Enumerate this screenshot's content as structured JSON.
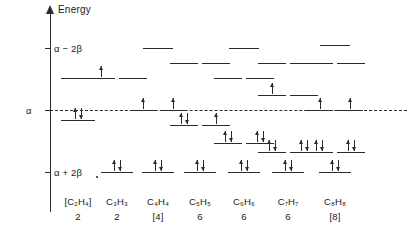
{
  "chart_data": {
    "type": "energy-level-diagram",
    "title": "",
    "ylabel": "Energy",
    "axis": {
      "ticks": [
        {
          "label": "α − 2β",
          "y": 48
        },
        {
          "label": "α",
          "y": 110
        },
        {
          "label": "α + 2β",
          "y": 172
        }
      ],
      "reference_line": "α",
      "grid": false
    },
    "columns": [
      {
        "formula": "[C₂H₄]",
        "electron_count": "2",
        "x": 78,
        "levels": [
          {
            "y": 78,
            "width": 34,
            "offset": 0,
            "electrons": ""
          },
          {
            "y": 120,
            "width": 34,
            "offset": 0,
            "electrons": "updown"
          }
        ]
      },
      {
        "formula": "C₃H₃",
        "electron_count": "2",
        "x": 117,
        "levels": [
          {
            "y": 78,
            "width": 28,
            "offset": -16,
            "electrons": "up"
          },
          {
            "y": 78,
            "width": 28,
            "offset": 16,
            "electrons": ""
          },
          {
            "y": 172,
            "width": 32,
            "offset": 0,
            "electrons": "updown"
          }
        ]
      },
      {
        "formula": "C₄H₄",
        "electron_count": "[4]",
        "x": 158,
        "levels": [
          {
            "y": 48,
            "width": 30,
            "offset": 0,
            "electrons": ""
          },
          {
            "y": 110,
            "width": 26,
            "offset": -15,
            "electrons": "up"
          },
          {
            "y": 110,
            "width": 26,
            "offset": 15,
            "electrons": "up"
          },
          {
            "y": 172,
            "width": 32,
            "offset": 0,
            "electrons": "updown"
          }
        ]
      },
      {
        "formula": "C₅H₅",
        "electron_count": "6",
        "x": 200,
        "levels": [
          {
            "y": 63,
            "width": 28,
            "offset": -16,
            "electrons": ""
          },
          {
            "y": 63,
            "width": 28,
            "offset": 16,
            "electrons": ""
          },
          {
            "y": 125,
            "width": 28,
            "offset": -16,
            "electrons": "updown"
          },
          {
            "y": 125,
            "width": 28,
            "offset": 16,
            "electrons": "up"
          },
          {
            "y": 172,
            "width": 32,
            "offset": 0,
            "electrons": "updown"
          }
        ]
      },
      {
        "formula": "C₆H₆",
        "electron_count": "6",
        "x": 244,
        "levels": [
          {
            "y": 48,
            "width": 30,
            "offset": 0,
            "electrons": ""
          },
          {
            "y": 78,
            "width": 28,
            "offset": -16,
            "electrons": ""
          },
          {
            "y": 78,
            "width": 28,
            "offset": 16,
            "electrons": ""
          },
          {
            "y": 143,
            "width": 28,
            "offset": -16,
            "electrons": "updown"
          },
          {
            "y": 143,
            "width": 28,
            "offset": 16,
            "electrons": "updown"
          },
          {
            "y": 172,
            "width": 32,
            "offset": 0,
            "electrons": "updown"
          }
        ]
      },
      {
        "formula": "C₇H₇",
        "electron_count": "6",
        "x": 288,
        "levels": [
          {
            "y": 63,
            "width": 28,
            "offset": -16,
            "electrons": ""
          },
          {
            "y": 63,
            "width": 28,
            "offset": 16,
            "electrons": ""
          },
          {
            "y": 95,
            "width": 28,
            "offset": -16,
            "electrons": "up"
          },
          {
            "y": 95,
            "width": 28,
            "offset": 16,
            "electrons": ""
          },
          {
            "y": 152,
            "width": 28,
            "offset": -16,
            "electrons": "updown"
          },
          {
            "y": 152,
            "width": 28,
            "offset": 16,
            "electrons": "updown"
          },
          {
            "y": 172,
            "width": 32,
            "offset": 0,
            "electrons": "updown"
          }
        ]
      },
      {
        "formula": "C₈H₈",
        "electron_count": "[8]",
        "x": 335,
        "levels": [
          {
            "y": 45,
            "width": 30,
            "offset": 0,
            "electrons": ""
          },
          {
            "y": 63,
            "width": 28,
            "offset": -16,
            "electrons": ""
          },
          {
            "y": 63,
            "width": 28,
            "offset": 16,
            "electrons": ""
          },
          {
            "y": 110,
            "width": 26,
            "offset": -15,
            "electrons": "up"
          },
          {
            "y": 110,
            "width": 26,
            "offset": 15,
            "electrons": "up"
          },
          {
            "y": 152,
            "width": 28,
            "offset": -16,
            "electrons": "updown"
          },
          {
            "y": 152,
            "width": 28,
            "offset": 16,
            "electrons": "updown"
          },
          {
            "y": 172,
            "width": 32,
            "offset": 0,
            "electrons": "updown"
          }
        ]
      }
    ]
  },
  "colors": {
    "ink": "#2b2b2b",
    "background": "#ffffff"
  }
}
